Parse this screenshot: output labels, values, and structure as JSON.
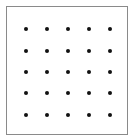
{
  "diagram": {
    "type": "dot-grid",
    "rows": 5,
    "columns": 5,
    "dot_color": "#111111",
    "border_color": "#8a8a8a",
    "grid_x": [
      26,
      47,
      68,
      89,
      110
    ],
    "grid_y": [
      29,
      51,
      72,
      93,
      115
    ]
  }
}
